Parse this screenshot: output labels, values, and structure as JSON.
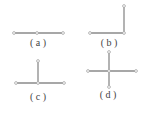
{
  "figure": {
    "panels": [
      {
        "id": "a",
        "label": "( a )",
        "label_pos": [
          38,
          46
        ],
        "segments": [
          [
            [
              14,
              33
            ],
            [
              63,
              33
            ]
          ]
        ],
        "nodes": [
          [
            14,
            33
          ],
          [
            37,
            33
          ],
          [
            63,
            33
          ]
        ]
      },
      {
        "id": "b",
        "label": "( b )",
        "label_pos": [
          109,
          46
        ],
        "segments": [
          [
            [
              90,
              33
            ],
            [
              124,
              33
            ]
          ],
          [
            [
              124,
              33
            ],
            [
              124,
              6
            ]
          ]
        ],
        "nodes": [
          [
            90,
            33
          ],
          [
            124,
            33
          ],
          [
            124,
            6
          ]
        ]
      },
      {
        "id": "c",
        "label": "( c )",
        "label_pos": [
          38,
          100
        ],
        "segments": [
          [
            [
              16,
              83
            ],
            [
              64,
              83
            ]
          ],
          [
            [
              38,
              83
            ],
            [
              38,
              61
            ]
          ]
        ],
        "nodes": [
          [
            16,
            83
          ],
          [
            38,
            83
          ],
          [
            64,
            83
          ],
          [
            38,
            61
          ]
        ]
      },
      {
        "id": "d",
        "label": "( d )",
        "label_pos": [
          108,
          98
        ],
        "segments": [
          [
            [
              88,
              71
            ],
            [
              136,
              71
            ]
          ],
          [
            [
              109,
              52
            ],
            [
              109,
              87
            ]
          ]
        ],
        "nodes": [
          [
            88,
            71
          ],
          [
            109,
            71
          ],
          [
            136,
            71
          ],
          [
            109,
            52
          ],
          [
            109,
            87
          ]
        ]
      }
    ],
    "colors": {
      "line": "#8a8a8a",
      "label": "#444444",
      "background": "#ffffff"
    }
  }
}
